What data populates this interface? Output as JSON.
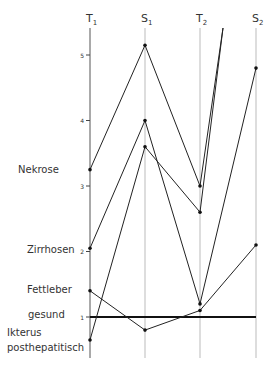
{
  "chart_data": {
    "type": "line",
    "title": "",
    "xlabel": "",
    "ylabel": "",
    "categories": [
      "T1",
      "S1",
      "T2",
      "S2"
    ],
    "category_labels": [
      {
        "main": "T",
        "sub": "1"
      },
      {
        "main": "S",
        "sub": "1"
      },
      {
        "main": "T",
        "sub": "2"
      },
      {
        "main": "S",
        "sub": "2"
      }
    ],
    "y_ticks": [
      1,
      2,
      3,
      4,
      5
    ],
    "ylim": [
      0.4,
      5.4
    ],
    "grid": false,
    "category_labels_left": [
      {
        "text": "Nekrose",
        "value": 3.3
      },
      {
        "text": "Zirrhosen",
        "value": 2.05
      },
      {
        "text": "Fettleber",
        "value": 1.4
      },
      {
        "text": "gesund",
        "value": 1.05
      },
      {
        "text": "Ikterus",
        "value": 0.75
      },
      {
        "text": "posthepatitisch",
        "value": 0.45
      }
    ],
    "reference_line": {
      "name": "gesund",
      "value": 1.0
    },
    "series": [
      {
        "name": "Patient 1",
        "values": [
          3.25,
          5.15,
          3.0,
          null
        ],
        "continues_off_chart_after": "T2"
      },
      {
        "name": "Patient 2",
        "values": [
          2.05,
          4.0,
          1.2,
          4.8
        ]
      },
      {
        "name": "Patient 3",
        "values": [
          0.65,
          3.6,
          2.6,
          null
        ],
        "continues_off_chart_after": "T2"
      },
      {
        "name": "Patient 4",
        "values": [
          1.4,
          0.8,
          1.1,
          2.1
        ]
      }
    ]
  }
}
